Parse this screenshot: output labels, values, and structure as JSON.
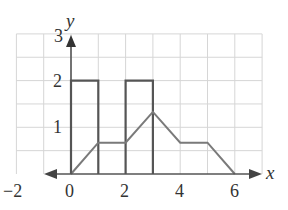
{
  "chart_data": {
    "type": "line",
    "title": "",
    "xlabel": "x",
    "ylabel": "y",
    "xlim": [
      -2,
      7
    ],
    "ylim": [
      0,
      3
    ],
    "grid": true,
    "grid_step": {
      "x": 1,
      "y": 0.5
    },
    "x_ticks": [
      "-2",
      "0",
      "2",
      "4",
      "6"
    ],
    "y_ticks": [
      "1",
      "2",
      "3"
    ],
    "series": [
      {
        "name": "bars",
        "kind": "rectangles",
        "rects": [
          {
            "x0": 0,
            "x1": 1,
            "height": 2
          },
          {
            "x0": 2,
            "x1": 3,
            "height": 2
          }
        ]
      },
      {
        "name": "polyline",
        "kind": "line",
        "x": [
          0,
          1,
          2,
          3,
          4,
          5,
          6
        ],
        "y": [
          0,
          0.67,
          0.67,
          1.33,
          0.67,
          0.67,
          0
        ]
      }
    ],
    "colors": {
      "grid": "#d4d4d4",
      "axis": "#444444",
      "bars": "#555555",
      "line": "#777777"
    }
  },
  "labels": {
    "x_axis": "x",
    "y_axis": "y",
    "x_tick_neg2": "−2",
    "x_tick_0": "0",
    "x_tick_2": "2",
    "x_tick_4": "4",
    "x_tick_6": "6",
    "y_tick_1": "1",
    "y_tick_2": "2",
    "y_tick_3": "3"
  }
}
